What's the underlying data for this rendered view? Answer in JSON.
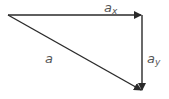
{
  "diagram": {
    "stroke_color": "#2a2a2a",
    "label_color": "#555555",
    "vectors": [
      {
        "id": "ax",
        "label": "a",
        "subscript": "x",
        "from": [
          8,
          15
        ],
        "to": [
          142,
          15
        ]
      },
      {
        "id": "ay",
        "label": "a",
        "subscript": "y",
        "from": [
          142,
          15
        ],
        "to": [
          142,
          91
        ]
      },
      {
        "id": "a",
        "label": "a",
        "subscript": "",
        "from": [
          8,
          15
        ],
        "to": [
          142,
          91
        ]
      }
    ],
    "labels": {
      "ax": {
        "base": "a",
        "sub": "x"
      },
      "ay": {
        "base": "a",
        "sub": "y"
      },
      "a": {
        "base": "a"
      }
    }
  }
}
